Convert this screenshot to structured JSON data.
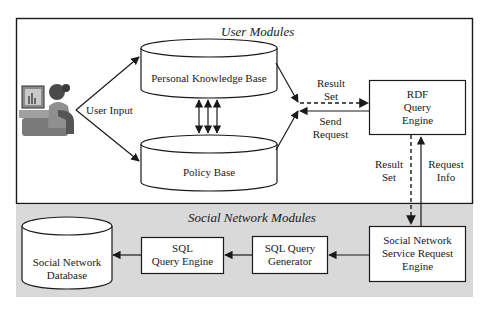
{
  "diagram": {
    "groups": {
      "user_modules": {
        "title": "User Modules"
      },
      "social_network_modules": {
        "title": "Social Network Modules"
      }
    },
    "nodes": {
      "user": {
        "icon": "person-at-computer-icon"
      },
      "personal_knowledge_base": {
        "label": "Personal Knowledge Base",
        "shape": "cylinder"
      },
      "policy_base": {
        "label": "Policy Base",
        "shape": "cylinder"
      },
      "rdf_query_engine": {
        "line1": "RDF",
        "line2": "Query",
        "line3": "Engine",
        "shape": "box"
      },
      "sn_service_request_engine": {
        "line1": "Social Network",
        "line2": "Service Request",
        "line3": "Engine",
        "shape": "box"
      },
      "sql_query_generator": {
        "line1": "SQL Query",
        "line2": "Generator",
        "shape": "box"
      },
      "sql_query_engine": {
        "line1": "SQL",
        "line2": "Query Engine",
        "shape": "box"
      },
      "social_network_database": {
        "line1": "Social Network",
        "line2": "Database",
        "shape": "cylinder"
      }
    },
    "edge_labels": {
      "user_input": "User Input",
      "result_set_top_1": "Result",
      "result_set_top_2": "Set",
      "send_request_1": "Send",
      "send_request_2": "Request",
      "result_set_right_1": "Result",
      "result_set_right_2": "Set",
      "request_info_1": "Request",
      "request_info_2": "Info"
    },
    "colors": {
      "stroke": "#1a1a1a",
      "background": "#ffffff",
      "social_band": "#d9d9d9"
    }
  }
}
